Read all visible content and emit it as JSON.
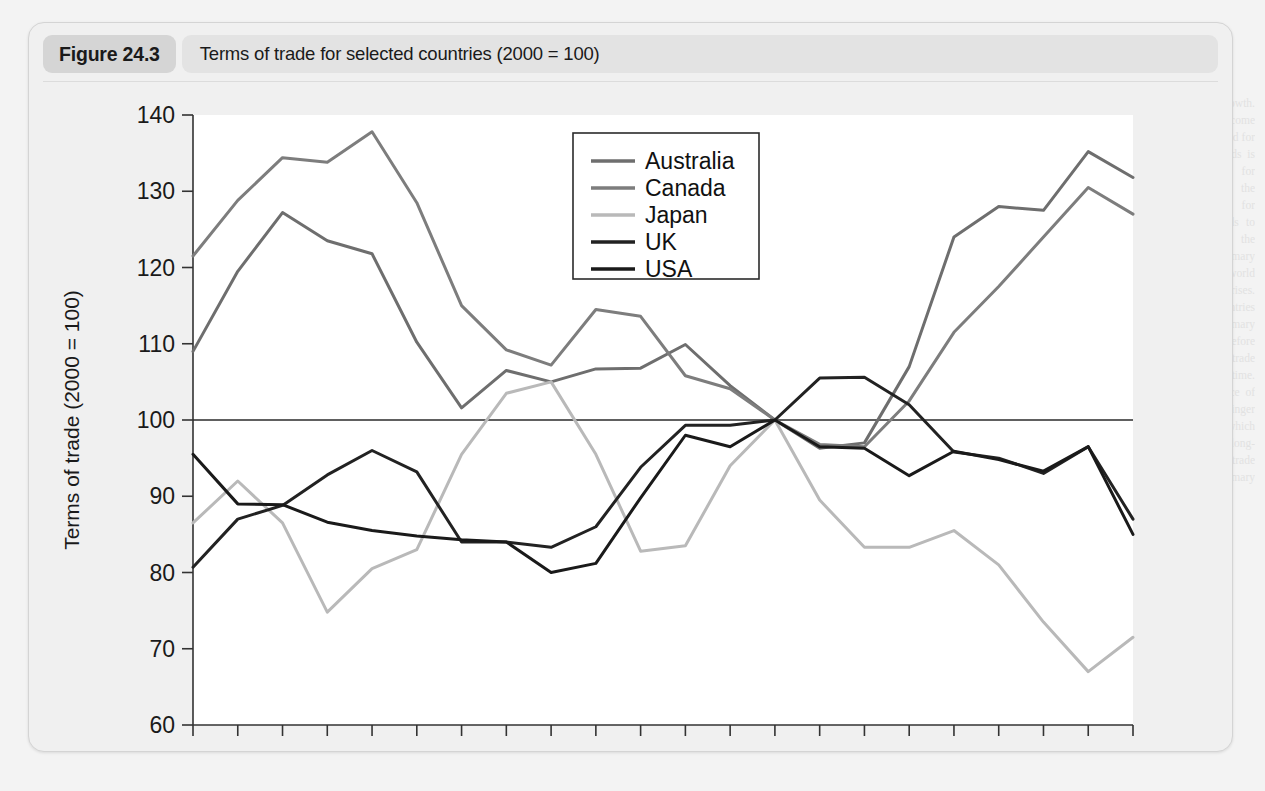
{
  "figure": {
    "tag": "Figure 24.3",
    "caption": "Terms of trade for selected countries (2000 = 100)"
  },
  "background_text": {
    "heading": "The terms of trade",
    "col1": "and economic growth. Because income elasticity of demand for manufactured goods is higher than that for primary products, the demand for manufactures tends to grow faster than the demand for primary commodities as world income rises. Developing countries that rely on primary exports may therefore see their terms of trade deteriorate over time. This is the essence of the Prebisch-Singer hypothesis, which argued that the long-run terms of trade move against primary producers.",
    "col2": "A country's terms of trade are measured as the ratio of an index of its export prices to an index of its import prices. A rise in the index means that export prices have risen relative to import prices, and the country can obtain a greater volume of imports for a given volume of exports. This is described as an improvement in the terms of trade. Conversely, a fall in the index represents a deterioration."
  },
  "chart_data": {
    "type": "line",
    "title": "Terms of trade for selected countries (2000 = 100)",
    "xlabel": "",
    "ylabel": "Terms of trade (2000 = 100)",
    "xlim": [
      1987,
      2008
    ],
    "ylim": [
      60,
      140
    ],
    "yticks": [
      60,
      70,
      80,
      90,
      100,
      110,
      120,
      130,
      140
    ],
    "xticks": [
      1987,
      1989,
      1991,
      1993,
      1995,
      1997,
      1999,
      2001,
      2003,
      2005,
      2007
    ],
    "xtick_all": [
      1987,
      1988,
      1989,
      1990,
      1991,
      1992,
      1993,
      1994,
      1995,
      1996,
      1997,
      1998,
      1999,
      2000,
      2001,
      2002,
      2003,
      2004,
      2005,
      2006,
      2007,
      2008
    ],
    "grid": false,
    "reference_line": 100,
    "legend_position": "upper-center-right",
    "x": [
      1987,
      1988,
      1989,
      1990,
      1991,
      1992,
      1993,
      1994,
      1995,
      1996,
      1997,
      1998,
      1999,
      2000,
      2001,
      2002,
      2003,
      2004,
      2005,
      2006,
      2007,
      2008
    ],
    "series": [
      {
        "name": "Australia",
        "color": "#6e6e6e",
        "values": [
          109.0,
          119.5,
          127.2,
          123.5,
          121.8,
          110.2,
          101.6,
          106.5,
          105.0,
          106.7,
          106.8,
          109.9,
          104.5,
          100.0,
          96.3,
          97.0,
          107.0,
          124.0,
          128.0,
          127.5,
          135.2,
          131.8
        ]
      },
      {
        "name": "Canada",
        "color": "#7d7d7d",
        "values": [
          121.5,
          128.8,
          134.4,
          133.8,
          137.8,
          128.5,
          115.0,
          109.2,
          107.2,
          114.5,
          113.6,
          105.8,
          104.1,
          100.0,
          96.8,
          96.5,
          102.5,
          111.5,
          117.5,
          124.0,
          130.5,
          127.0
        ]
      },
      {
        "name": "Japan",
        "color": "#b9b9b9",
        "values": [
          86.5,
          92.0,
          86.5,
          74.8,
          80.5,
          83.0,
          95.5,
          103.5,
          105.0,
          95.5,
          82.8,
          83.5,
          94.0,
          100.0,
          89.5,
          83.3,
          83.3,
          85.5,
          81.0,
          73.5,
          67.0,
          71.5
        ]
      },
      {
        "name": "UK",
        "color": "#222222",
        "values": [
          80.7,
          87.0,
          88.8,
          92.8,
          96.0,
          93.2,
          84.0,
          84.0,
          83.3,
          86.0,
          93.8,
          99.3,
          99.3,
          100.0,
          105.5,
          105.6,
          102.0,
          95.8,
          95.0,
          93.0,
          96.5,
          87.0
        ]
      },
      {
        "name": "USA",
        "color": "#1a1a1a",
        "values": [
          95.5,
          89.0,
          88.9,
          86.6,
          85.5,
          84.8,
          84.3,
          84.0,
          80.0,
          81.2,
          89.8,
          98.0,
          96.5,
          100.0,
          96.5,
          96.3,
          92.7,
          95.9,
          94.8,
          93.3,
          96.5,
          85.0
        ]
      }
    ]
  }
}
